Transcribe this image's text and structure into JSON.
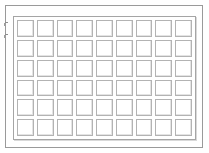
{
  "diagram": {
    "type": "technical-line-drawing",
    "canvas": {
      "width": 209,
      "height": 153,
      "background": "#ffffff"
    },
    "outer_frame": {
      "name": "outer-border",
      "x": 5,
      "y": 5,
      "width": 198,
      "height": 143,
      "stroke": "#9a9a9a",
      "stroke_width": 1
    },
    "inner_frame": {
      "name": "panel-body",
      "x": 13,
      "y": 16,
      "width": 183,
      "height": 124,
      "stroke": "#a5a5a5",
      "stroke_width": 1,
      "shadow": "#d9d9d9"
    },
    "grid": {
      "name": "cell-grid",
      "columns": 9,
      "rows": 6,
      "cell_count": 54,
      "cell_stroke": "#b3b3b3",
      "cell_fill": "#ffffff",
      "cell_shadow": "#e4e4e4",
      "gap": 1,
      "x": 16,
      "y": 19,
      "width": 177,
      "height": 118
    },
    "tick_marks": [
      {
        "name": "tick-upper",
        "x": 5,
        "y": 22,
        "length": 3,
        "stroke": "#8e8e8e"
      },
      {
        "name": "tick-lower",
        "x": 5,
        "y": 34,
        "length": 3,
        "stroke": "#8e8e8e"
      }
    ],
    "cells": [
      {
        "row": 1,
        "col": 1
      },
      {
        "row": 1,
        "col": 2
      },
      {
        "row": 1,
        "col": 3
      },
      {
        "row": 1,
        "col": 4
      },
      {
        "row": 1,
        "col": 5
      },
      {
        "row": 1,
        "col": 6
      },
      {
        "row": 1,
        "col": 7
      },
      {
        "row": 1,
        "col": 8
      },
      {
        "row": 1,
        "col": 9
      },
      {
        "row": 2,
        "col": 1
      },
      {
        "row": 2,
        "col": 2
      },
      {
        "row": 2,
        "col": 3
      },
      {
        "row": 2,
        "col": 4
      },
      {
        "row": 2,
        "col": 5
      },
      {
        "row": 2,
        "col": 6
      },
      {
        "row": 2,
        "col": 7
      },
      {
        "row": 2,
        "col": 8
      },
      {
        "row": 2,
        "col": 9
      },
      {
        "row": 3,
        "col": 1
      },
      {
        "row": 3,
        "col": 2
      },
      {
        "row": 3,
        "col": 3
      },
      {
        "row": 3,
        "col": 4
      },
      {
        "row": 3,
        "col": 5
      },
      {
        "row": 3,
        "col": 6
      },
      {
        "row": 3,
        "col": 7
      },
      {
        "row": 3,
        "col": 8
      },
      {
        "row": 3,
        "col": 9
      },
      {
        "row": 4,
        "col": 1
      },
      {
        "row": 4,
        "col": 2
      },
      {
        "row": 4,
        "col": 3
      },
      {
        "row": 4,
        "col": 4
      },
      {
        "row": 4,
        "col": 5
      },
      {
        "row": 4,
        "col": 6
      },
      {
        "row": 4,
        "col": 7
      },
      {
        "row": 4,
        "col": 8
      },
      {
        "row": 4,
        "col": 9
      },
      {
        "row": 5,
        "col": 1
      },
      {
        "row": 5,
        "col": 2
      },
      {
        "row": 5,
        "col": 3
      },
      {
        "row": 5,
        "col": 4
      },
      {
        "row": 5,
        "col": 5
      },
      {
        "row": 5,
        "col": 6
      },
      {
        "row": 5,
        "col": 7
      },
      {
        "row": 5,
        "col": 8
      },
      {
        "row": 5,
        "col": 9
      },
      {
        "row": 6,
        "col": 1
      },
      {
        "row": 6,
        "col": 2
      },
      {
        "row": 6,
        "col": 3
      },
      {
        "row": 6,
        "col": 4
      },
      {
        "row": 6,
        "col": 5
      },
      {
        "row": 6,
        "col": 6
      },
      {
        "row": 6,
        "col": 7
      },
      {
        "row": 6,
        "col": 8
      },
      {
        "row": 6,
        "col": 9
      }
    ]
  }
}
